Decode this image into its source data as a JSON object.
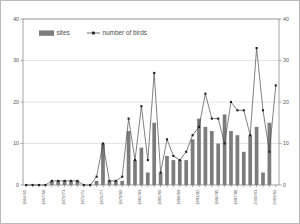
{
  "chart_data": {
    "type": "bar",
    "title": "",
    "xlabel": "",
    "ylabel": "",
    "ylim": [
      0,
      40
    ],
    "y2lim": [
      0,
      40
    ],
    "yticks": [
      0,
      10,
      20,
      30,
      40
    ],
    "y2ticks": [
      0,
      10,
      20,
      30,
      40
    ],
    "grid": true,
    "legend_position": "top-left",
    "categories": [
      "1964/65",
      "1965/66",
      "1966/67",
      "1967/68",
      "1968/69",
      "1969/70",
      "1970/71",
      "1971/72",
      "1972/73",
      "1973/74",
      "1974/75",
      "1975/76",
      "1976/77",
      "1977/78",
      "1978/79",
      "1979/80",
      "1980/81",
      "1981/82",
      "1982/83",
      "1983/84",
      "1984/85",
      "1985/86",
      "1986/87",
      "1987/88",
      "1988/89",
      "1989/90",
      "1990/91",
      "1991/92",
      "1992/93",
      "1993/94",
      "1994/95",
      "1995/96",
      "1996/97",
      "1997/98",
      "1998/99",
      "1999/00",
      "2000/01",
      "2001/02",
      "2002/03",
      "2003/04"
    ],
    "tick_labels": [
      "1964/65",
      "1967/68",
      "1970/71",
      "1973/74",
      "1976/77",
      "1979/80",
      "1982/83",
      "1985/86",
      "1988/89",
      "1991/92",
      "1994/95",
      "1997/98",
      "2000/01",
      "2003/04"
    ],
    "tick_label_interval": 3,
    "series": [
      {
        "name": "sites",
        "render": "bar",
        "color": "#7c7c7c",
        "values": [
          0,
          0,
          0,
          0,
          1,
          1,
          1,
          1,
          1,
          0,
          0,
          1,
          10,
          1,
          1,
          1,
          13,
          6,
          9,
          3,
          15,
          3,
          7,
          6,
          6,
          6,
          11,
          16,
          14,
          13,
          10,
          17,
          13,
          12,
          8,
          12,
          14,
          3,
          15,
          0
        ]
      },
      {
        "name": "number of birds",
        "render": "line",
        "color": "#4a4a4a",
        "marker": "square",
        "values": [
          0,
          0,
          0,
          0,
          1,
          1,
          1,
          1,
          1,
          0,
          0,
          2,
          10,
          1,
          1,
          2,
          16,
          6,
          19,
          6,
          27,
          3,
          11,
          7,
          6,
          8,
          12,
          14,
          22,
          16,
          16,
          10,
          20,
          18,
          18,
          12,
          33,
          18,
          8,
          24
        ]
      }
    ],
    "legend": [
      {
        "label": "sites",
        "marker": "swatch",
        "color": "#7c7c7c"
      },
      {
        "label": "number of birds",
        "marker": "line-point",
        "color": "#4a4a4a"
      }
    ]
  },
  "colors": {
    "bar": "#7c7c7c",
    "line": "#4a4a4a",
    "marker": "#1e1e1e",
    "grid": "#d5d5d5",
    "axis": "#8a8a8a",
    "frame": "#b9b9b9",
    "background": "#ffffff"
  }
}
